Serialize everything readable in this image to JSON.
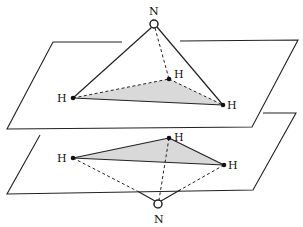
{
  "diagram": {
    "top_molecule": {
      "apex_label": "N",
      "base_labels": [
        "H",
        "H",
        "H"
      ]
    },
    "bottom_molecule": {
      "apex_label": "N",
      "base_labels": [
        "H",
        "H",
        "H"
      ]
    },
    "colors": {
      "line": "#222222",
      "shading": "#d9d9d9",
      "background": "#ffffff"
    }
  }
}
